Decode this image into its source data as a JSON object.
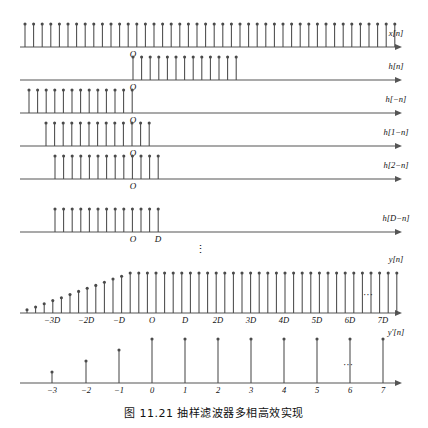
{
  "figure": {
    "caption": "图 11.21    抽样滤波器多相高效实现",
    "stem_color": "#4a4a4a",
    "axis_color": "#555555",
    "text_color": "#111111"
  },
  "rows": [
    {
      "id": "x-n",
      "label": "x[n]",
      "origin_label": "O",
      "origin_label_pos": "below",
      "axis_y": 47,
      "axis_x0": 20,
      "axis_x1": 402,
      "stem_start": 25,
      "stem_count": 44,
      "stem_spacing": 8.6,
      "stem_height": 23,
      "origin_x": 133,
      "ticks": [],
      "ellipsis": false
    },
    {
      "id": "h-n",
      "label": "h[n]",
      "origin_label": "O",
      "origin_label_pos": "below",
      "axis_y": 80,
      "axis_x0": 20,
      "axis_x1": 402,
      "stem_start": 133,
      "stem_count": 13,
      "stem_spacing": 8.6,
      "stem_height": 23,
      "origin_x": 133,
      "ticks": [],
      "ellipsis": false
    },
    {
      "id": "h-minus-n",
      "label": "h[−n]",
      "origin_label": "O",
      "origin_label_pos": "below",
      "axis_y": 113,
      "axis_x0": 20,
      "axis_x1": 402,
      "stem_start": 29,
      "stem_count": 13,
      "stem_spacing": 8.6,
      "stem_height": 23,
      "origin_x": 133,
      "ticks": [],
      "ellipsis": false
    },
    {
      "id": "h-1-minus-n",
      "label": "h[1−n]",
      "origin_label": "O",
      "origin_label_pos": "below",
      "axis_y": 146,
      "axis_x0": 20,
      "axis_x1": 402,
      "stem_start": 46,
      "stem_count": 13,
      "stem_spacing": 8.6,
      "stem_height": 23,
      "origin_x": 133,
      "ticks": [],
      "ellipsis": false
    },
    {
      "id": "h-2-minus-n",
      "label": "h[2−n]",
      "origin_label": "O",
      "origin_label_pos": "below",
      "axis_y": 179,
      "axis_x0": 20,
      "axis_x1": 402,
      "stem_start": 55,
      "stem_count": 13,
      "stem_spacing": 8.6,
      "stem_height": 23,
      "origin_x": 133,
      "ticks": [],
      "ellipsis": false
    },
    {
      "id": "h-D-minus-n",
      "label": "h[D−n]",
      "origin_label": "O",
      "origin_label_pos": "below",
      "axis_y": 232,
      "axis_x0": 20,
      "axis_x1": 402,
      "stem_start": 55,
      "stem_count": 13,
      "stem_spacing": 8.6,
      "stem_height": 23,
      "origin_x": 133,
      "ticks": [
        {
          "x": 133,
          "text": "O"
        },
        {
          "x": 158,
          "text": "D"
        }
      ],
      "ellipsis": false
    }
  ],
  "vertical_ellipsis": {
    "x": 200,
    "y": 253,
    "glyph": "⋮"
  },
  "output_rows": [
    {
      "id": "y-n",
      "label": "y[n]",
      "label_y": 262,
      "axis_y": 313,
      "axis_x0": 20,
      "axis_x1": 402,
      "ellipsis_x": 368,
      "ellipsis_y": 298,
      "ellipsis": "···",
      "ticks": [
        {
          "x": 52,
          "text": "−3D"
        },
        {
          "x": 86,
          "text": "−2D"
        },
        {
          "x": 119,
          "text": "−D"
        },
        {
          "x": 152,
          "text": "O"
        },
        {
          "x": 185,
          "text": "D"
        },
        {
          "x": 218,
          "text": "2D"
        },
        {
          "x": 251,
          "text": "3D"
        },
        {
          "x": 284,
          "text": "4D"
        },
        {
          "x": 317,
          "text": "5D"
        },
        {
          "x": 350,
          "text": "6D"
        },
        {
          "x": 383,
          "text": "7D"
        }
      ]
    },
    {
      "id": "y-prime-n",
      "label": "y'[n]",
      "label_y": 335,
      "axis_y": 383,
      "axis_x0": 20,
      "axis_x1": 402,
      "ellipsis_x": 348,
      "ellipsis_y": 368,
      "ellipsis": "···",
      "ticks": [
        {
          "x": 52,
          "text": "−3"
        },
        {
          "x": 86,
          "text": "−2"
        },
        {
          "x": 119,
          "text": "−1"
        },
        {
          "x": 152,
          "text": "0"
        },
        {
          "x": 185,
          "text": "1"
        },
        {
          "x": 218,
          "text": "2"
        },
        {
          "x": 251,
          "text": "3"
        },
        {
          "x": 284,
          "text": "4"
        },
        {
          "x": 317,
          "text": "5"
        },
        {
          "x": 350,
          "text": "6"
        },
        {
          "x": 383,
          "text": "7"
        }
      ]
    }
  ],
  "chart_data": {
    "type": "line",
    "title": "图 11.21  抽样滤波器多相高效实现",
    "xlabel": "n",
    "ylabel": "",
    "grid": false,
    "legend_position": "right",
    "series": [
      {
        "name": "x[n]",
        "description": "Uniform unit-amplitude impulse train, 44 samples spanning the whole axis",
        "x": [
          0,
          1,
          2,
          3,
          4,
          5,
          6,
          7,
          8,
          9,
          10,
          11,
          12,
          13,
          14,
          15,
          16,
          17,
          18,
          19,
          20,
          21,
          22,
          23,
          24,
          25,
          26,
          27,
          28,
          29,
          30,
          31,
          32,
          33,
          34,
          35,
          36,
          37,
          38,
          39,
          40,
          41,
          42,
          43
        ],
        "values": [
          1,
          1,
          1,
          1,
          1,
          1,
          1,
          1,
          1,
          1,
          1,
          1,
          1,
          1,
          1,
          1,
          1,
          1,
          1,
          1,
          1,
          1,
          1,
          1,
          1,
          1,
          1,
          1,
          1,
          1,
          1,
          1,
          1,
          1,
          1,
          1,
          1,
          1,
          1,
          1,
          1,
          1,
          1,
          1
        ]
      },
      {
        "name": "h[n]",
        "description": "Causal impulse response, 13 unit samples starting at n = 0",
        "x": [
          0,
          1,
          2,
          3,
          4,
          5,
          6,
          7,
          8,
          9,
          10,
          11,
          12
        ],
        "values": [
          1,
          1,
          1,
          1,
          1,
          1,
          1,
          1,
          1,
          1,
          1,
          1,
          1
        ]
      },
      {
        "name": "h[-n]",
        "description": "Time-reversed impulse response, 13 unit samples ending at n = 0",
        "x": [
          -12,
          -11,
          -10,
          -9,
          -8,
          -7,
          -6,
          -5,
          -4,
          -3,
          -2,
          -1,
          0
        ],
        "values": [
          1,
          1,
          1,
          1,
          1,
          1,
          1,
          1,
          1,
          1,
          1,
          1,
          1
        ]
      },
      {
        "name": "h[1-n]",
        "description": "Time-reversed impulse response shifted right by 1",
        "x": [
          -11,
          -10,
          -9,
          -8,
          -7,
          -6,
          -5,
          -4,
          -3,
          -2,
          -1,
          0,
          1
        ],
        "values": [
          1,
          1,
          1,
          1,
          1,
          1,
          1,
          1,
          1,
          1,
          1,
          1,
          1
        ]
      },
      {
        "name": "h[2-n]",
        "description": "Time-reversed impulse response shifted right by 2",
        "x": [
          -10,
          -9,
          -8,
          -7,
          -6,
          -5,
          -4,
          -3,
          -2,
          -1,
          0,
          1,
          2
        ],
        "values": [
          1,
          1,
          1,
          1,
          1,
          1,
          1,
          1,
          1,
          1,
          1,
          1,
          1
        ]
      },
      {
        "name": "h[D-n]",
        "description": "Time-reversed impulse response shifted right by D",
        "x": [
          -9,
          -8,
          -7,
          -6,
          -5,
          -4,
          -3,
          -2,
          -1,
          0,
          1,
          2,
          3
        ],
        "values": [
          1,
          1,
          1,
          1,
          1,
          1,
          1,
          1,
          1,
          1,
          1,
          1,
          1
        ]
      },
      {
        "name": "y[n]",
        "description": "Convolution output: linear ramp rising over the first 13 samples then constant",
        "x": [
          -16,
          -15,
          -14,
          -13,
          -12,
          -11,
          -10,
          -9,
          -8,
          -7,
          -6,
          -5,
          -4,
          -3,
          -2,
          -1,
          0,
          1,
          2,
          3,
          4,
          5,
          6,
          7,
          8,
          9,
          10,
          11,
          12,
          13,
          14,
          15,
          16,
          17,
          18,
          19,
          20,
          21,
          22,
          23,
          24,
          25,
          26,
          27
        ],
        "values": [
          0.08,
          0.15,
          0.23,
          0.31,
          0.38,
          0.46,
          0.54,
          0.62,
          0.69,
          0.77,
          0.85,
          0.92,
          1,
          1,
          1,
          1,
          1,
          1,
          1,
          1,
          1,
          1,
          1,
          1,
          1,
          1,
          1,
          1,
          1,
          1,
          1,
          1,
          1,
          1,
          1,
          1,
          1,
          1,
          1,
          1,
          1,
          1,
          1,
          1
        ]
      },
      {
        "name": "y'[n]",
        "description": "Decimated output sampled every D: ramp at n = -3,-2,-1 then constant from n = 0",
        "x": [
          -3,
          -2,
          -1,
          0,
          1,
          2,
          3,
          4,
          5,
          6,
          7
        ],
        "values": [
          0.25,
          0.5,
          0.75,
          1,
          1,
          1,
          1,
          1,
          1,
          1,
          1
        ]
      }
    ]
  }
}
